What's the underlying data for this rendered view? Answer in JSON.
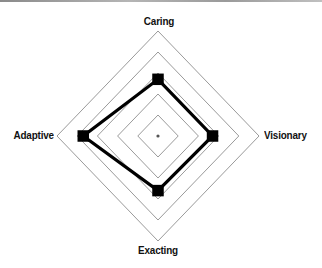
{
  "chart_data": {
    "type": "radar",
    "title": "",
    "axes": [
      "Caring",
      "Visionary",
      "Exacting",
      "Adaptive"
    ],
    "scale": {
      "min": 0,
      "max": 5,
      "rings": 5
    },
    "series": [
      {
        "name": "Profile",
        "values": [
          2.7,
          2.7,
          2.6,
          3.7
        ],
        "color": "#000000",
        "marker": "square"
      }
    ],
    "grid": true,
    "legend": null
  },
  "labels": {
    "top": "Caring",
    "right": "Visionary",
    "bottom": "Exacting",
    "left": "Adaptive"
  },
  "colors": {
    "grid": "#9a9a9a",
    "series": "#000000",
    "center_dot": "#555555"
  }
}
